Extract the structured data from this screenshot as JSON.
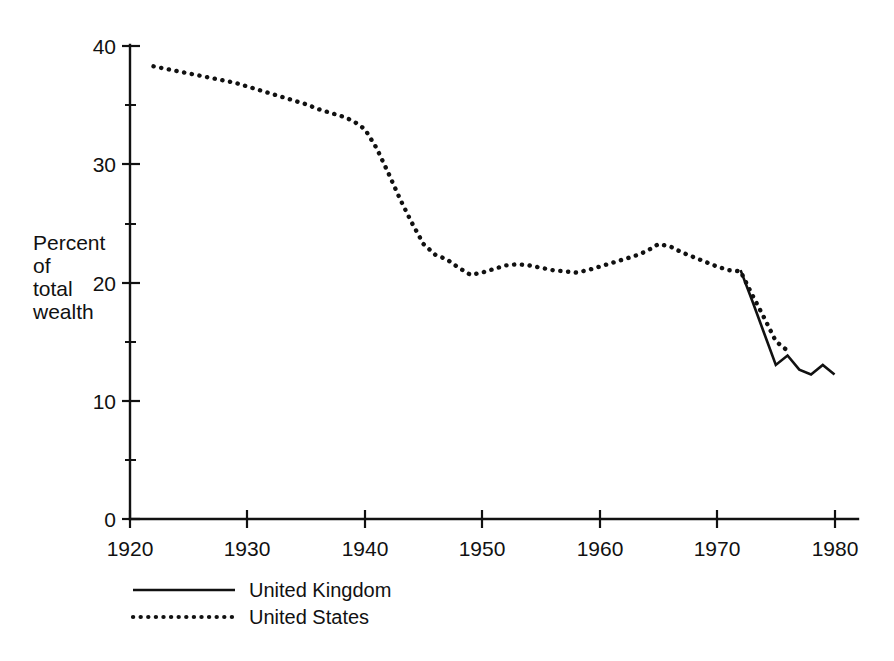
{
  "chart_data": {
    "type": "line",
    "title": "",
    "subtitle": "",
    "xlabel": "",
    "ylabel": "Percent of total wealth",
    "ylabel_lines": [
      "Percent",
      "of",
      "total",
      "wealth"
    ],
    "xlim": [
      1920,
      1982
    ],
    "ylim": [
      0,
      40
    ],
    "x_ticks": [
      1920,
      1930,
      1940,
      1950,
      1960,
      1970,
      1980
    ],
    "x_tick_labels": [
      "1920",
      "1930",
      "1940",
      "1950",
      "1960",
      "1970",
      "1980"
    ],
    "y_ticks": [
      0,
      10,
      20,
      30,
      40
    ],
    "y_tick_labels": [
      "0",
      "10",
      "20",
      "30",
      "40"
    ],
    "y_minor_ticks": [
      5,
      15,
      25,
      35
    ],
    "grid": false,
    "legend_position": "bottom-left",
    "line_color": "#111111",
    "background_color": "#ffffff",
    "series": [
      {
        "name": "United Kingdom",
        "style": "solid",
        "x": [
          1972,
          1973,
          1974,
          1975,
          1976,
          1977,
          1978,
          1979,
          1980
        ],
        "values": [
          21.0,
          18.4,
          15.7,
          13.0,
          13.8,
          12.6,
          12.2,
          13.0,
          12.2
        ]
      },
      {
        "name": "United States",
        "style": "dotted",
        "x": [
          1922,
          1923,
          1924,
          1925,
          1926,
          1927,
          1928,
          1929,
          1930,
          1931,
          1932,
          1933,
          1934,
          1935,
          1936,
          1937,
          1938,
          1939,
          1940,
          1941,
          1942,
          1943,
          1944,
          1945,
          1946,
          1947,
          1948,
          1949,
          1950,
          1951,
          1952,
          1953,
          1954,
          1955,
          1956,
          1957,
          1958,
          1959,
          1960,
          1961,
          1962,
          1963,
          1964,
          1965,
          1966,
          1967,
          1968,
          1969,
          1970,
          1971,
          1972,
          1973,
          1974,
          1975,
          1976
        ],
        "values": [
          38.2,
          38.0,
          37.8,
          37.6,
          37.4,
          37.2,
          37.0,
          36.8,
          36.5,
          36.2,
          35.9,
          35.6,
          35.3,
          35.0,
          34.6,
          34.3,
          34.0,
          33.6,
          32.9,
          31.3,
          29.2,
          27.0,
          25.0,
          23.2,
          22.3,
          21.9,
          21.2,
          20.6,
          20.8,
          21.1,
          21.4,
          21.5,
          21.4,
          21.2,
          21.0,
          20.9,
          20.8,
          21.0,
          21.3,
          21.6,
          21.9,
          22.2,
          22.6,
          23.2,
          23.0,
          22.5,
          22.1,
          21.7,
          21.3,
          21.0,
          20.9,
          18.9,
          17.0,
          15.0,
          14.2
        ]
      }
    ],
    "legend": [
      {
        "label": "United Kingdom",
        "style": "solid"
      },
      {
        "label": "United States",
        "style": "dotted"
      }
    ]
  }
}
